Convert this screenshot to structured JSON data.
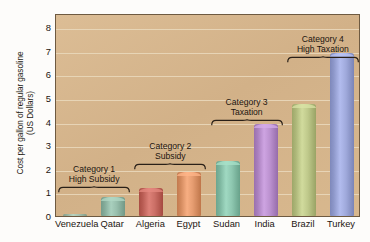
{
  "chart_data": {
    "type": "bar",
    "title": "",
    "xlabel": "",
    "ylabel": "Cost per gallon of regular gasoline (US Dollars)",
    "ylabel_line1": "Cost per gallon of regular gasoline",
    "ylabel_line2": "(US Dollars)",
    "categories": [
      "Venezuela",
      "Qatar",
      "Algeria",
      "Egypt",
      "Sudan",
      "India",
      "Brazil",
      "Turkey"
    ],
    "values": [
      0.1,
      0.8,
      1.2,
      1.85,
      2.35,
      3.9,
      4.75,
      6.9
    ],
    "ylim": [
      0,
      8.6
    ],
    "yticks": [
      0,
      1,
      2,
      3,
      4,
      5,
      6,
      7,
      8
    ],
    "ytick_labels": [
      "0",
      "1",
      "2",
      "3",
      "4",
      "5",
      "6",
      "7",
      "8"
    ],
    "grid": true,
    "legend": "none",
    "bar_colors": [
      "#9fb9a6",
      "#8fb6a4",
      "#c3675e",
      "#dd9468",
      "#86bfa8",
      "#b48ac8",
      "#b7c183",
      "#98a2d4"
    ],
    "plot_background": "#d6b68d",
    "annotations": [
      {
        "label_line1": "Category 1",
        "label_line2": "High Subsidy",
        "spans": [
          "Venezuela",
          "Qatar"
        ]
      },
      {
        "label_line1": "Category 2",
        "label_line2": "Subsidy",
        "spans": [
          "Algeria",
          "Egypt"
        ]
      },
      {
        "label_line1": "Category 3",
        "label_line2": "Taxation",
        "spans": [
          "Sudan",
          "India"
        ]
      },
      {
        "label_line1": "Category 4",
        "label_line2": "High Taxation",
        "spans": [
          "Brazil",
          "Turkey"
        ]
      }
    ]
  }
}
